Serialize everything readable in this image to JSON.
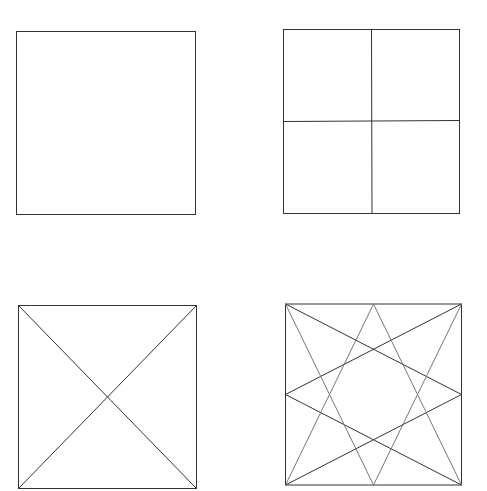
{
  "figure": {
    "stroke_color": "#333333",
    "panels": [
      {
        "id": "plain-square",
        "x": 16,
        "y": 31,
        "w": 179,
        "h": 183,
        "lines": []
      },
      {
        "id": "quartered-square",
        "x": 283,
        "y": 29,
        "w": 176,
        "h": 184,
        "lines": [
          "vertical-midline",
          "horizontal-midline"
        ]
      },
      {
        "id": "diagonal-square",
        "x": 18,
        "y": 305,
        "w": 178,
        "h": 183,
        "lines": [
          "diagonal-tl-br",
          "diagonal-tr-bl"
        ]
      },
      {
        "id": "star-square",
        "x": 285,
        "y": 304,
        "w": 176,
        "h": 181,
        "lines": [
          "corner-to-midside lines forming 8-point star"
        ]
      }
    ]
  }
}
